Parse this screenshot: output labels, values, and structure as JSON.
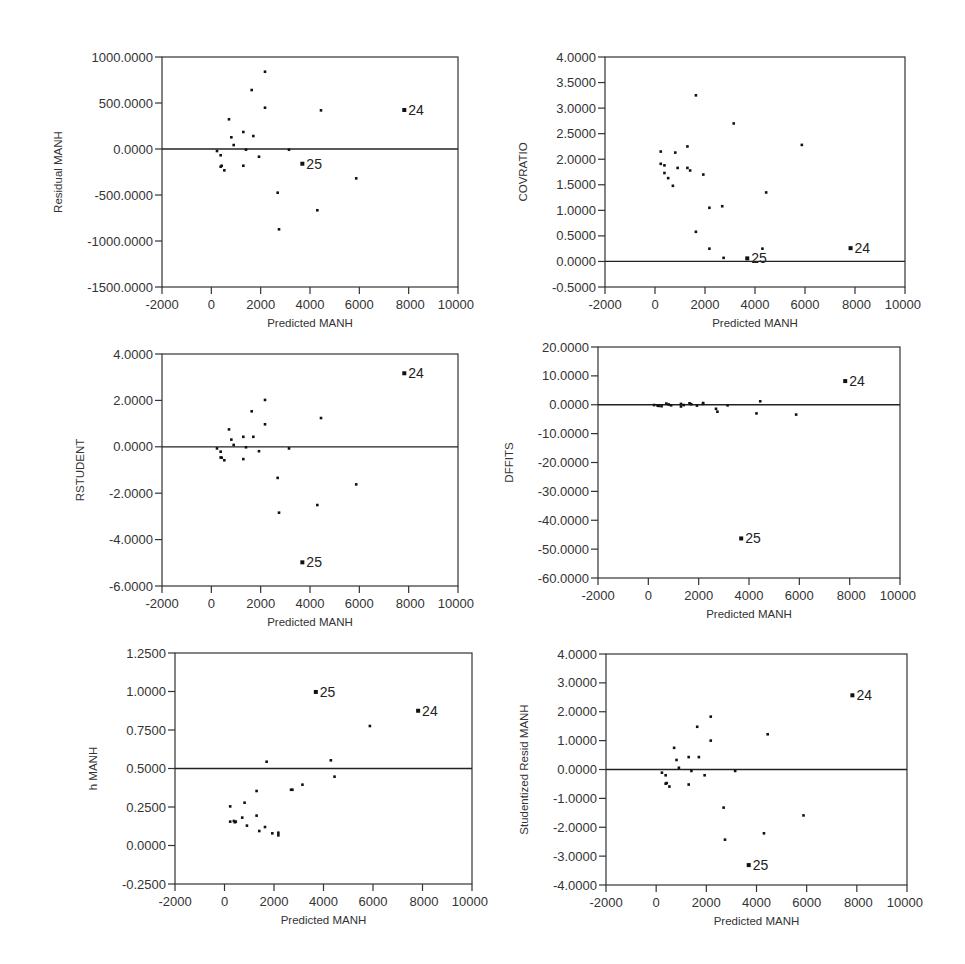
{
  "figure": {
    "shared_x": {
      "label": "Predicted MANH",
      "range": [
        -2000,
        10000
      ],
      "ticks": [
        -2000,
        0,
        2000,
        4000,
        6000,
        8000,
        10000
      ],
      "tick_labels": [
        "-2000",
        "0",
        "2000",
        "4000",
        "6000",
        "8000",
        "10000"
      ]
    },
    "observation_labels": [
      "24",
      "25"
    ]
  },
  "chart_data": [
    {
      "id": "residual",
      "type": "scatter",
      "title": "",
      "xlabel": "Predicted MANH",
      "ylabel": "Residual MANH",
      "xlim": [
        -2000,
        10000
      ],
      "ylim": [
        -1500,
        1000
      ],
      "yticks": [
        1000,
        500,
        0,
        -500,
        -1000,
        -1500
      ],
      "ytick_labels": [
        "1000.0000",
        "500.0000",
        "0.0000",
        "-500.0000",
        "-1000.0000",
        "-1500.0000"
      ],
      "reference_line": 0,
      "grid": false,
      "frame": {
        "left": 162,
        "top": 57,
        "right": 458,
        "bottom": 287
      },
      "points": [
        {
          "x": 230,
          "y": -22
        },
        {
          "x": 378,
          "y": -68
        },
        {
          "x": 378,
          "y": -192
        },
        {
          "x": 419,
          "y": -182
        },
        {
          "x": 527,
          "y": -232
        },
        {
          "x": 716,
          "y": 323
        },
        {
          "x": 811,
          "y": 127
        },
        {
          "x": 906,
          "y": 43
        },
        {
          "x": 1297,
          "y": 185
        },
        {
          "x": 1297,
          "y": -182
        },
        {
          "x": 1405,
          "y": -7
        },
        {
          "x": 1636,
          "y": 641
        },
        {
          "x": 1703,
          "y": 141
        },
        {
          "x": 1932,
          "y": -84
        },
        {
          "x": 2176,
          "y": 840
        },
        {
          "x": 2176,
          "y": 449
        },
        {
          "x": 2689,
          "y": -475
        },
        {
          "x": 2744,
          "y": -873
        },
        {
          "x": 3149,
          "y": -7
        },
        {
          "x": 3690,
          "y": -160,
          "label": "25"
        },
        {
          "x": 4297,
          "y": -666
        },
        {
          "x": 4446,
          "y": 420
        },
        {
          "x": 5874,
          "y": -319
        },
        {
          "x": 7823,
          "y": 424,
          "label": "24"
        }
      ]
    },
    {
      "id": "covratio",
      "type": "scatter",
      "title": "",
      "xlabel": "Predicted MANH",
      "ylabel": "COVRATIO",
      "xlim": [
        -2000,
        10000
      ],
      "ylim": [
        -0.5,
        4.0
      ],
      "yticks": [
        4.0,
        3.5,
        3.0,
        2.5,
        2.0,
        1.5,
        1.0,
        0.5,
        0.0,
        -0.5
      ],
      "ytick_labels": [
        "4.0000",
        "3.5000",
        "3.0000",
        "2.5000",
        "2.0000",
        "1.5000",
        "1.0000",
        "0.5000",
        "0.0000",
        "-0.5000"
      ],
      "reference_line": 0,
      "grid": false,
      "frame": {
        "left": 605,
        "top": 57,
        "right": 905,
        "bottom": 287
      },
      "points": [
        {
          "x": 230,
          "y": 2.15
        },
        {
          "x": 230,
          "y": 1.91
        },
        {
          "x": 378,
          "y": 1.88
        },
        {
          "x": 378,
          "y": 1.73
        },
        {
          "x": 527,
          "y": 1.63
        },
        {
          "x": 716,
          "y": 1.48
        },
        {
          "x": 811,
          "y": 2.13
        },
        {
          "x": 906,
          "y": 1.83
        },
        {
          "x": 1297,
          "y": 2.25
        },
        {
          "x": 1297,
          "y": 1.83
        },
        {
          "x": 1405,
          "y": 1.78
        },
        {
          "x": 1636,
          "y": 3.25
        },
        {
          "x": 1636,
          "y": 0.58
        },
        {
          "x": 1932,
          "y": 1.7
        },
        {
          "x": 2176,
          "y": 1.05
        },
        {
          "x": 2176,
          "y": 0.25
        },
        {
          "x": 2689,
          "y": 1.08
        },
        {
          "x": 2744,
          "y": 0.07
        },
        {
          "x": 3149,
          "y": 2.7
        },
        {
          "x": 3690,
          "y": 0.06,
          "label": "25"
        },
        {
          "x": 4297,
          "y": 0.25
        },
        {
          "x": 4446,
          "y": 1.35
        },
        {
          "x": 5874,
          "y": 2.28
        },
        {
          "x": 7823,
          "y": 0.26,
          "label": "24"
        }
      ]
    },
    {
      "id": "rstudent",
      "type": "scatter",
      "title": "",
      "xlabel": "Predicted MANH",
      "ylabel": "RSTUDENT",
      "xlim": [
        -2000,
        10000
      ],
      "ylim": [
        -6.0,
        4.0
      ],
      "yticks": [
        4.0,
        2.0,
        0.0,
        -2.0,
        -4.0,
        -6.0
      ],
      "ytick_labels": [
        "4.0000",
        "2.0000",
        "0.0000",
        "-2.0000",
        "-4.0000",
        "-6.0000"
      ],
      "reference_line": 0,
      "grid": false,
      "frame": {
        "left": 162,
        "top": 354,
        "right": 458,
        "bottom": 586
      },
      "points": [
        {
          "x": 230,
          "y": -0.07
        },
        {
          "x": 378,
          "y": -0.21
        },
        {
          "x": 378,
          "y": -0.46
        },
        {
          "x": 419,
          "y": -0.47
        },
        {
          "x": 527,
          "y": -0.58
        },
        {
          "x": 716,
          "y": 0.75
        },
        {
          "x": 811,
          "y": 0.31
        },
        {
          "x": 906,
          "y": 0.08
        },
        {
          "x": 1297,
          "y": 0.43
        },
        {
          "x": 1297,
          "y": -0.53
        },
        {
          "x": 1405,
          "y": -0.02
        },
        {
          "x": 1636,
          "y": 1.53
        },
        {
          "x": 1703,
          "y": 0.43
        },
        {
          "x": 1932,
          "y": -0.19
        },
        {
          "x": 2176,
          "y": 2.02
        },
        {
          "x": 2176,
          "y": 0.97
        },
        {
          "x": 2689,
          "y": -1.34
        },
        {
          "x": 2744,
          "y": -2.84
        },
        {
          "x": 3149,
          "y": -0.07
        },
        {
          "x": 3690,
          "y": -4.98,
          "label": "25"
        },
        {
          "x": 4297,
          "y": -2.51
        },
        {
          "x": 4446,
          "y": 1.24
        },
        {
          "x": 5874,
          "y": -1.62
        },
        {
          "x": 7823,
          "y": 3.17,
          "label": "24"
        }
      ]
    },
    {
      "id": "dffits",
      "type": "scatter",
      "title": "",
      "xlabel": "Predicted MANH",
      "ylabel": "DFFITS",
      "xlim": [
        -2000,
        10000
      ],
      "ylim": [
        -60,
        20
      ],
      "yticks": [
        20,
        10,
        0,
        -10,
        -20,
        -30,
        -40,
        -50,
        -60
      ],
      "ytick_labels": [
        "20.0000",
        "10.0000",
        "0.0000",
        "-10.0000",
        "-20.0000",
        "-30.0000",
        "-40.0000",
        "-50.0000",
        "-60.0000"
      ],
      "reference_line": 0,
      "grid": false,
      "frame": {
        "left": 598,
        "top": 347,
        "right": 900,
        "bottom": 578
      },
      "points": [
        {
          "x": 230,
          "y": -0.1
        },
        {
          "x": 378,
          "y": -0.2
        },
        {
          "x": 378,
          "y": -0.3
        },
        {
          "x": 419,
          "y": -0.4
        },
        {
          "x": 527,
          "y": -0.5
        },
        {
          "x": 716,
          "y": 0.4
        },
        {
          "x": 811,
          "y": 0.1
        },
        {
          "x": 906,
          "y": -0.2
        },
        {
          "x": 1297,
          "y": 0.3
        },
        {
          "x": 1297,
          "y": -0.6
        },
        {
          "x": 1405,
          "y": -0.1
        },
        {
          "x": 1636,
          "y": 0.5
        },
        {
          "x": 1703,
          "y": 0.2
        },
        {
          "x": 1932,
          "y": -0.3
        },
        {
          "x": 2176,
          "y": 0.6
        },
        {
          "x": 2176,
          "y": 0.3
        },
        {
          "x": 2689,
          "y": -1.4
        },
        {
          "x": 2744,
          "y": -2.4
        },
        {
          "x": 3149,
          "y": -0.2
        },
        {
          "x": 3690,
          "y": -46.3,
          "label": "25"
        },
        {
          "x": 4297,
          "y": -3.0
        },
        {
          "x": 4446,
          "y": 1.2
        },
        {
          "x": 5874,
          "y": -3.4
        },
        {
          "x": 7823,
          "y": 8.2,
          "label": "24"
        }
      ]
    },
    {
      "id": "hat",
      "type": "scatter",
      "title": "",
      "xlabel": "Predicted MANH",
      "ylabel": "h MANH",
      "xlim": [
        -2000,
        10000
      ],
      "ylim": [
        -0.25,
        1.25
      ],
      "yticks": [
        1.25,
        1.0,
        0.75,
        0.5,
        0.25,
        0.0,
        -0.25
      ],
      "ytick_labels": [
        "1.2500",
        "1.0000",
        "0.7500",
        "0.5000",
        "0.2500",
        "0.0000",
        "-0.2500"
      ],
      "reference_line": 0.5,
      "grid": false,
      "frame": {
        "left": 175,
        "top": 653,
        "right": 472,
        "bottom": 884
      },
      "points": [
        {
          "x": 230,
          "y": 0.254
        },
        {
          "x": 230,
          "y": 0.155
        },
        {
          "x": 378,
          "y": 0.159
        },
        {
          "x": 419,
          "y": 0.151
        },
        {
          "x": 456,
          "y": 0.155
        },
        {
          "x": 716,
          "y": 0.181
        },
        {
          "x": 811,
          "y": 0.278
        },
        {
          "x": 906,
          "y": 0.129
        },
        {
          "x": 1297,
          "y": 0.354
        },
        {
          "x": 1297,
          "y": 0.194
        },
        {
          "x": 1405,
          "y": 0.094
        },
        {
          "x": 1703,
          "y": 0.544
        },
        {
          "x": 1636,
          "y": 0.12
        },
        {
          "x": 1932,
          "y": 0.079
        },
        {
          "x": 2176,
          "y": 0.066
        },
        {
          "x": 2176,
          "y": 0.083
        },
        {
          "x": 2689,
          "y": 0.362
        },
        {
          "x": 2744,
          "y": 0.362
        },
        {
          "x": 3149,
          "y": 0.395
        },
        {
          "x": 3690,
          "y": 0.997,
          "label": "25"
        },
        {
          "x": 4297,
          "y": 0.553
        },
        {
          "x": 4446,
          "y": 0.447
        },
        {
          "x": 5874,
          "y": 0.776
        },
        {
          "x": 7823,
          "y": 0.875,
          "label": "24"
        }
      ]
    },
    {
      "id": "studentized",
      "type": "scatter",
      "title": "",
      "xlabel": "Predicted MANH",
      "ylabel": "Studentized Resid MANH",
      "xlim": [
        -2000,
        10000
      ],
      "ylim": [
        -4.0,
        4.0
      ],
      "yticks": [
        4.0,
        3.0,
        2.0,
        1.0,
        0.0,
        -1.0,
        -2.0,
        -3.0,
        -4.0
      ],
      "ytick_labels": [
        "4.0000",
        "3.0000",
        "2.0000",
        "1.0000",
        "0.0000",
        "-1.0000",
        "-2.0000",
        "-3.0000",
        "-4.0000"
      ],
      "reference_line": 0,
      "grid": false,
      "frame": {
        "left": 606,
        "top": 654,
        "right": 907,
        "bottom": 885
      },
      "points": [
        {
          "x": 230,
          "y": -0.11
        },
        {
          "x": 378,
          "y": -0.2
        },
        {
          "x": 378,
          "y": -0.49
        },
        {
          "x": 419,
          "y": -0.47
        },
        {
          "x": 527,
          "y": -0.59
        },
        {
          "x": 716,
          "y": 0.75
        },
        {
          "x": 811,
          "y": 0.33
        },
        {
          "x": 906,
          "y": 0.06
        },
        {
          "x": 1297,
          "y": 0.43
        },
        {
          "x": 1297,
          "y": -0.52
        },
        {
          "x": 1405,
          "y": -0.05
        },
        {
          "x": 1636,
          "y": 1.48
        },
        {
          "x": 1703,
          "y": 0.43
        },
        {
          "x": 1932,
          "y": -0.2
        },
        {
          "x": 2176,
          "y": 1.83
        },
        {
          "x": 2176,
          "y": 1.0
        },
        {
          "x": 2689,
          "y": -1.32
        },
        {
          "x": 2744,
          "y": -2.43
        },
        {
          "x": 3149,
          "y": -0.05
        },
        {
          "x": 3690,
          "y": -3.31,
          "label": "25"
        },
        {
          "x": 4297,
          "y": -2.21
        },
        {
          "x": 4446,
          "y": 1.22
        },
        {
          "x": 5874,
          "y": -1.59
        },
        {
          "x": 7823,
          "y": 2.57,
          "label": "24"
        }
      ]
    }
  ]
}
